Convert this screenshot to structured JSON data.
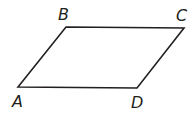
{
  "diagram": {
    "shape": "parallelogram",
    "stroke_color": "#231f20",
    "vertices": [
      {
        "label": "A",
        "x": 18,
        "y": 87,
        "lx": 12,
        "ly": 107
      },
      {
        "label": "B",
        "x": 66,
        "y": 27,
        "lx": 58,
        "ly": 20
      },
      {
        "label": "C",
        "x": 184,
        "y": 28,
        "lx": 176,
        "ly": 21
      },
      {
        "label": "D",
        "x": 137,
        "y": 88,
        "lx": 131,
        "ly": 108
      }
    ]
  }
}
